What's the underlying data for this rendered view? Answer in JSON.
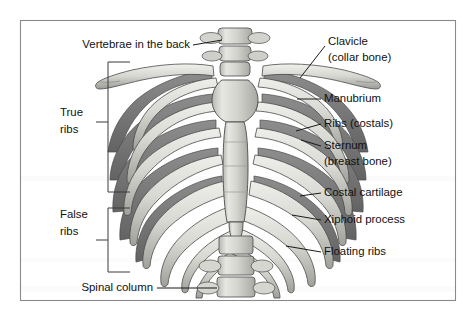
{
  "figure": {
    "frame": {
      "x": 20,
      "y": 20,
      "width": 436,
      "height": 281,
      "border_color": "#8a8a8a",
      "background": "#ffffff"
    },
    "palette": {
      "bone_light": "#dcdcd8",
      "bone_mid": "#c2c2bd",
      "bone_shadow": "#9a9a96",
      "posterior_rib_dark": "#7e7e7e",
      "posterior_rib_darker": "#6a6a6a",
      "outline": "#4a4a4a",
      "text": "#111111",
      "leader_line": "#1a1a1a"
    }
  },
  "labels": {
    "vertebrae_back": {
      "text": "Vertebrae in the back",
      "x": 190,
      "y": 45,
      "align": "end"
    },
    "true_ribs_line1": {
      "text": "True",
      "x": 60,
      "y": 113,
      "align": "start"
    },
    "true_ribs_line2": {
      "text": "ribs",
      "x": 60,
      "y": 130,
      "align": "start"
    },
    "false_ribs_line1": {
      "text": "False",
      "x": 60,
      "y": 215,
      "align": "start"
    },
    "false_ribs_line2": {
      "text": "ribs",
      "x": 60,
      "y": 232,
      "align": "start"
    },
    "spinal_column": {
      "text": "Spinal column",
      "x": 153,
      "y": 288,
      "align": "end"
    },
    "clavicle_line1": {
      "text": "Clavicle",
      "x": 328,
      "y": 42,
      "align": "start"
    },
    "clavicle_line2": {
      "text": "(collar bone)",
      "x": 328,
      "y": 58,
      "align": "start"
    },
    "manubrium": {
      "text": "Manubrium",
      "x": 324,
      "y": 99,
      "align": "start"
    },
    "ribs_costals": {
      "text": "Ribs (costals)",
      "x": 324,
      "y": 124,
      "align": "start"
    },
    "sternum_line1": {
      "text": "Sternum",
      "x": 324,
      "y": 146,
      "align": "start"
    },
    "sternum_line2": {
      "text": "(breast bone)",
      "x": 324,
      "y": 162,
      "align": "start"
    },
    "costal_cartilage": {
      "text": "Costal cartilage",
      "x": 324,
      "y": 193,
      "align": "start"
    },
    "xiphoid_process": {
      "text": "Xiphoid process",
      "x": 324,
      "y": 220,
      "align": "start"
    },
    "floating_ribs": {
      "text": "Floating ribs",
      "x": 324,
      "y": 252,
      "align": "start"
    }
  },
  "brackets": {
    "true_ribs": {
      "top": 62,
      "bottom": 192,
      "x_spine": 108,
      "x_arm": 130,
      "tick_y": 122,
      "tick_x": 96
    },
    "false_ribs": {
      "top": 208,
      "bottom": 272,
      "x_spine": 108,
      "x_arm": 130,
      "tick_y": 240,
      "tick_x": 96
    }
  },
  "structures": {
    "rib_pairs": 12,
    "true_rib_pairs": 7,
    "false_rib_pairs": 5,
    "floating_rib_pairs": 2,
    "lumbar_vertebrae_shown": 4,
    "sternum_parts": [
      "Manubrium",
      "Body of sternum",
      "Xiphoid process"
    ],
    "clavicles": 2
  }
}
